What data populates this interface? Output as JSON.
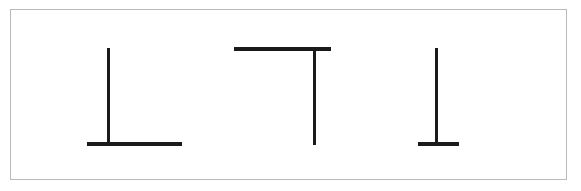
{
  "panel": {
    "background_color": "#ffffff",
    "border_color": "#b9b9b9",
    "frame": {
      "x": 10,
      "y": 9,
      "width": 557,
      "height": 171
    }
  },
  "chart_data": {
    "type": "diagram",
    "title": "",
    "subtitle": "",
    "xlabel": "",
    "ylabel": "",
    "stroke_color": "#1b1b1b",
    "background_color": "#ffffff",
    "canvas": {
      "width": 581,
      "height": 191
    },
    "figures": [
      {
        "name": "inverted-t-left-offset",
        "label": "Figure 1",
        "glyph": "⊥",
        "segments": [
          {
            "name": "vertical-stem",
            "orientation": "vertical",
            "x1": 108.5,
            "y1": 48,
            "x2": 108.5,
            "y2": 145,
            "thickness": 3,
            "length": 97
          },
          {
            "name": "horizontal-base",
            "orientation": "horizontal",
            "x1": 87,
            "y1": 144,
            "x2": 182,
            "y2": 144,
            "thickness": 4,
            "length": 95
          }
        ]
      },
      {
        "name": "upright-t-right-offset",
        "label": "Figure 2",
        "glyph": "⊤",
        "segments": [
          {
            "name": "horizontal-top",
            "orientation": "horizontal",
            "x1": 234,
            "y1": 49,
            "x2": 331,
            "y2": 49,
            "thickness": 4,
            "length": 97
          },
          {
            "name": "vertical-stem",
            "orientation": "vertical",
            "x1": 314.5,
            "y1": 48,
            "x2": 314.5,
            "y2": 145,
            "thickness": 3,
            "length": 97
          }
        ]
      },
      {
        "name": "inverted-t-short-base",
        "label": "Figure 3",
        "glyph": "⊥",
        "segments": [
          {
            "name": "vertical-stem",
            "orientation": "vertical",
            "x1": 436.5,
            "y1": 48,
            "x2": 436.5,
            "y2": 145,
            "thickness": 3,
            "length": 97
          },
          {
            "name": "horizontal-base",
            "orientation": "horizontal",
            "x1": 418,
            "y1": 144,
            "x2": 459,
            "y2": 144,
            "thickness": 4,
            "length": 41
          }
        ]
      }
    ]
  }
}
